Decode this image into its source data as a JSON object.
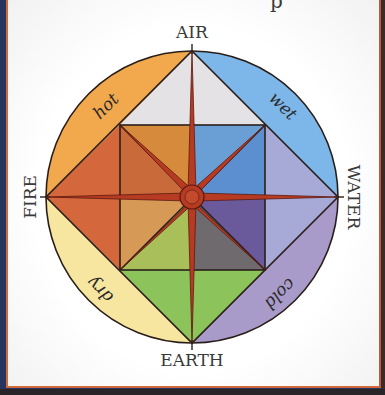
{
  "diagram": {
    "cut_off_caption_fragment": "p",
    "elements": {
      "top": "AIR",
      "left": "FIRE",
      "right": "WATER",
      "bottom": "EARTH"
    },
    "qualities": {
      "upper_left": "hot",
      "upper_right": "wet",
      "lower_left": "dry",
      "lower_right": "cold"
    },
    "colors": {
      "hot_band": "#f2a94e",
      "wet_band": "#7db6e8",
      "dry_band": "#f7e6a0",
      "cold_band": "#a99bc9",
      "air_triangle": "#e4e2e4",
      "fire_triangle": "#d4683c",
      "water_triangle": "#a7a9d6",
      "earth_triangle": "#8cc35a",
      "inner_ul_outer": "#d68a3c",
      "inner_ul_inner": "#c96a3a",
      "inner_ur_outer": "#6a9fd6",
      "inner_ur_inner": "#5b8fd0",
      "inner_ll_outer": "#a9bf5a",
      "inner_ll_inner": "#d79a56",
      "inner_lr_outer": "#6e6a8e",
      "inner_lr_inner": "#6a5a9c",
      "rose": "#b73a22",
      "outline": "#2a1e1a"
    }
  }
}
